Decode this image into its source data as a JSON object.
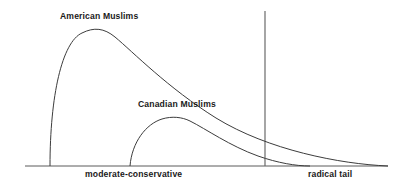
{
  "figure": {
    "background_color": "#ffffff",
    "line_color": "#3c3c3c",
    "axis_color": "#5a5a5a",
    "curves": [
      {
        "name": "American Muslims",
        "label": "American Muslims",
        "label_position": {
          "x": 60,
          "y": 12
        },
        "foot_left_x": 50,
        "peak": {
          "x": 105,
          "y": 30
        },
        "baseline_end_x": 388,
        "path": "M 50 166 C 50 96 62 42 82 33 C 94 27 104 28 115 37 C 133 52 168 88 216 118 C 268 150 340 164 388 166"
      },
      {
        "name": "Canadian Muslims",
        "label": "Canadian Muslims",
        "label_position": {
          "x": 138,
          "y": 100
        },
        "foot_left_x": 130,
        "peak": {
          "x": 180,
          "y": 117
        },
        "baseline_end_x": 310,
        "path": "M 130 166 C 132 142 146 124 162 119 C 172 116 182 117 190 121 C 206 129 230 146 258 156 C 278 163 296 166 310 166"
      }
    ],
    "axis": {
      "baseline": {
        "x1": 25,
        "y1": 166,
        "x2": 388,
        "y2": 166
      },
      "labels": [
        {
          "text": "moderate-conservative",
          "x": 85,
          "y": 170
        },
        {
          "text": "radical tail",
          "x": 308,
          "y": 170
        }
      ]
    },
    "divider": {
      "name": "threshold-divider",
      "x": 265,
      "y_top": 11,
      "y_bottom": 166
    }
  },
  "chart_data": {
    "type": "line",
    "title": "",
    "subtitle": "",
    "xlabel": "",
    "ylabel": "",
    "grid": false,
    "legend_position": "inline-annotation",
    "x_tick_labels": [
      "moderate-conservative",
      "radical tail"
    ],
    "y_tick_labels": [],
    "annotations": [
      {
        "text": "American Muslims",
        "x": 105,
        "y": 30
      },
      {
        "text": "Canadian Muslims",
        "x": 180,
        "y": 117
      }
    ],
    "vertical_reference_line": {
      "x_px": 265,
      "label": ""
    },
    "series": [
      {
        "name": "American Muslims",
        "description": "Right-skewed distribution with steep left rise, rounded peak near moderate-conservative, and a long gradual decline through the radical tail",
        "peak_x_px": 105,
        "start_x_px": 50,
        "end_x_px": 388,
        "values": [
          0,
          15,
          62,
          92,
          100,
          97,
          88,
          78,
          66,
          54,
          42,
          31,
          20,
          10,
          3,
          0
        ]
      },
      {
        "name": "Canadian Muslims",
        "description": "Lower-amplitude right-skewed distribution beginning further right, peaking after moderate-conservative and falling to zero before the far radical tail",
        "peak_x_px": 180,
        "start_x_px": 130,
        "end_x_px": 310,
        "values": [
          0,
          22,
          48,
          66,
          70,
          68,
          60,
          50,
          38,
          26,
          15,
          6,
          0
        ]
      }
    ]
  }
}
